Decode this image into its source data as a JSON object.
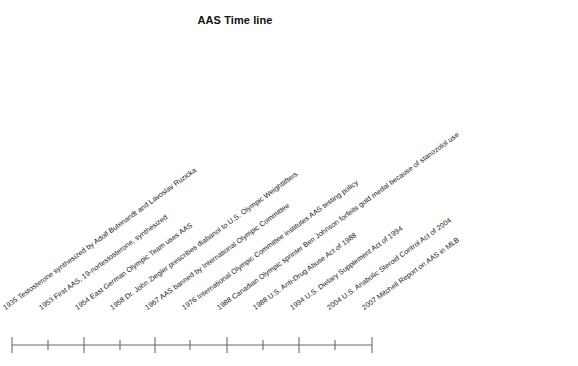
{
  "chart_data": {
    "type": "timeline",
    "title": "AAS Time line",
    "xlabel": "",
    "ylabel": "",
    "grid": false,
    "legend": "none",
    "axis": {
      "x_start_px": 12,
      "x_end_px": 372,
      "y_px": 345,
      "tick_count": 11,
      "tick_style": "alternating-major-minor"
    },
    "categories": [
      "1935",
      "1953",
      "1954",
      "1958",
      "1967",
      "1976",
      "1988",
      "1988",
      "1994",
      "2004",
      "2007"
    ],
    "events": [
      {
        "year": "1935",
        "text": "1935 Testosterone synthesized by Adolf Butenandt and Lavoslav Ruzicka",
        "x": 6,
        "y": 312
      },
      {
        "year": "1953",
        "text": "1953 First AAS, 19-nortestosterone, synthesized",
        "x": 42,
        "y": 312
      },
      {
        "year": "1954",
        "text": "1954 East German Olympic Team uses AAS",
        "x": 78,
        "y": 312
      },
      {
        "year": "1958",
        "text": "1958 Dr. John Ziegler prescribes diabanol to U.S. Olympic Weightlifters",
        "x": 113,
        "y": 312
      },
      {
        "year": "1967",
        "text": "1967 AAS banned by International Olympic Committee",
        "x": 148,
        "y": 312
      },
      {
        "year": "1976",
        "text": "1976 International Olympic Committee institutes AAS testing policy",
        "x": 185,
        "y": 312
      },
      {
        "year": "1988",
        "text": "1988 Canadian Olympic sprinter Ben Johnson forfeits gold medal because of stanozolol use",
        "x": 220,
        "y": 312
      },
      {
        "year": "1988",
        "text": "1988 U.S. Anti-Drug Abuse Act of 1988",
        "x": 256,
        "y": 312
      },
      {
        "year": "1994",
        "text": "1994 U.S. Dietary Supplement Act of 1994",
        "x": 293,
        "y": 312
      },
      {
        "year": "2004",
        "text": "2004 U.S. Anabolic Steroid Control Act of 2004",
        "x": 330,
        "y": 312
      },
      {
        "year": "2007",
        "text": "2007 Mitchell Report on AAS in MLB",
        "x": 365,
        "y": 312
      }
    ],
    "ticks": [
      {
        "x": 12,
        "major": true
      },
      {
        "x": 48,
        "major": false
      },
      {
        "x": 84,
        "major": true
      },
      {
        "x": 120,
        "major": false
      },
      {
        "x": 155,
        "major": true
      },
      {
        "x": 190,
        "major": false
      },
      {
        "x": 227,
        "major": true
      },
      {
        "x": 263,
        "major": false
      },
      {
        "x": 299,
        "major": true
      },
      {
        "x": 335,
        "major": false
      },
      {
        "x": 372,
        "major": true
      }
    ],
    "colors": {
      "background": "#ffffff",
      "text": "#1a1a1a",
      "axis": "#6b6b6b",
      "title": "#111111"
    }
  },
  "caption": {
    "text": ""
  }
}
